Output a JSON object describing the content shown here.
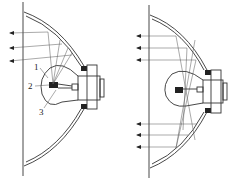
{
  "diagram": {
    "left_figure": {
      "description": "headlamp reflector with bulb, filament at focus, parallel rays upward",
      "labels": [
        {
          "id": "1",
          "text": "1"
        },
        {
          "id": "2",
          "text": "2"
        },
        {
          "id": "3",
          "text": "3"
        }
      ]
    },
    "right_figure": {
      "description": "headlamp reflector with bulb, rays reflected both up and down"
    },
    "colors": {
      "line": "#333333",
      "background": "#ffffff"
    }
  }
}
